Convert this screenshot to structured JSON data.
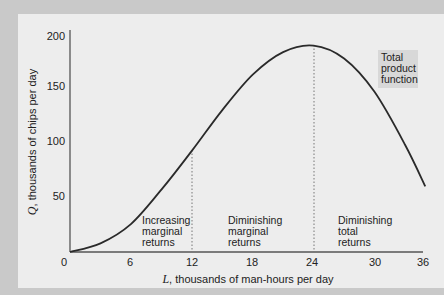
{
  "chart_data": {
    "type": "line",
    "title": "",
    "xlabel": "L, thousands of man-hours per day",
    "xlabel_var": "L",
    "xlabel_rest": ", thousands of man-hours per day",
    "ylabel": "Q, thousands of chips per day",
    "ylabel_var": "Q",
    "ylabel_rest": ", thousands of chips per day",
    "xlim": [
      0,
      36
    ],
    "ylim": [
      0,
      200
    ],
    "x_ticks": [
      "0",
      "6",
      "12",
      "18",
      "24",
      "30",
      "36"
    ],
    "y_ticks": [
      "50",
      "100",
      "150",
      "200"
    ],
    "grid": false,
    "series": [
      {
        "name": "Total product function",
        "x": [
          0,
          3,
          6,
          9,
          12,
          15,
          18,
          21,
          24,
          27,
          30,
          33,
          35
        ],
        "values": [
          0,
          8,
          26,
          58,
          94,
          132,
          165,
          186,
          192,
          180,
          149,
          100,
          61
        ]
      }
    ],
    "vertical_markers": [
      12,
      24
    ],
    "annotations": [
      {
        "lines": [
          "Increasing",
          "marginal",
          "returns"
        ]
      },
      {
        "lines": [
          "Diminishing",
          "marginal",
          "returns"
        ]
      },
      {
        "lines": [
          "Diminishing",
          "total",
          "returns"
        ]
      }
    ],
    "legend_label": [
      "Total",
      "product",
      "function"
    ]
  },
  "colors": {
    "curve": "#2a2a2a",
    "axis": "#555555",
    "panel": "#ededed",
    "frame": "#c9c9c9",
    "label_box": "#d8d8d8"
  }
}
